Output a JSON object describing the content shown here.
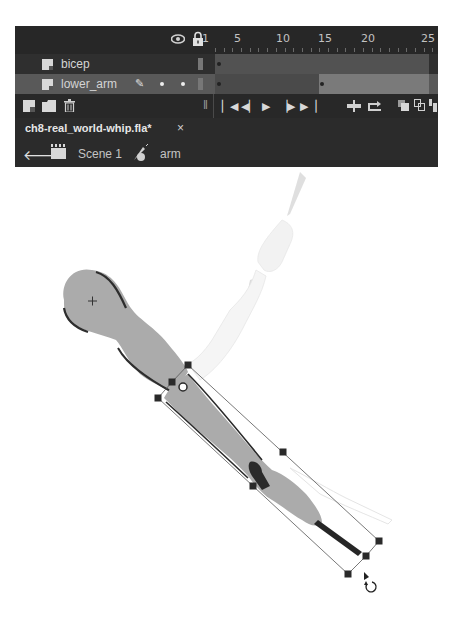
{
  "timeline": {
    "header": {
      "show_hide_icon": "eye-icon",
      "lock_icon": "lock-icon",
      "frame_numbers": [
        {
          "label": "1",
          "x": 202
        },
        {
          "label": "5",
          "x": 236
        },
        {
          "label": "10",
          "x": 278
        },
        {
          "label": "15",
          "x": 320
        },
        {
          "label": "20",
          "x": 363
        },
        {
          "label": "25",
          "x": 406
        }
      ]
    },
    "layers": [
      {
        "name": "bicep",
        "selected": false
      },
      {
        "name": "lower_arm",
        "selected": true,
        "edit_icon": "pencil-icon"
      }
    ],
    "controls": {
      "new_layer": "new-layer-icon",
      "new_folder": "new-folder-icon",
      "delete": "trash-icon",
      "first_frame": "⏮",
      "step_back": "◀|",
      "play": "▶",
      "step_forward": "|▶",
      "last_frame": "⏭",
      "center_frame": "center-frame-icon",
      "loop": "loop-icon",
      "onion_skin": "onion-skin-icon",
      "onion_outlines": "onion-outlines-icon",
      "edit_multiple": "edit-multiple-frames-icon"
    }
  },
  "document": {
    "filename": "ch8-real_world-whip.fla*",
    "close_label": "×"
  },
  "breadcrumb": {
    "back_icon": "back-arrow-icon",
    "scene_label": "Scene 1",
    "symbol_label": "arm"
  },
  "stage": {
    "selected_symbol": "lower_arm",
    "transform_tool": "free-transform",
    "cursor": "rotate-cursor"
  },
  "colors": {
    "panel_bg": "#2b2b2b",
    "selected_layer": "#595959",
    "arm_fill": "#ababab",
    "outline": "#2a2a2a",
    "ghost": "#ebebeb"
  }
}
